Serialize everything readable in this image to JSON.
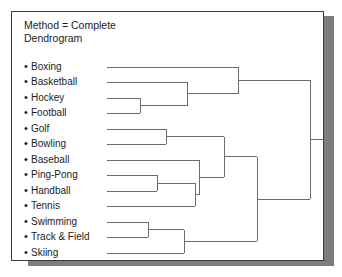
{
  "panel": {
    "header_lines": [
      "Method = Complete",
      "Dendrogram"
    ],
    "bullet_glyph": "•",
    "border_color": "#3a3a3a",
    "shadow_color": "#7d7d7d",
    "background_color": "#ffffff",
    "line_color": "#6b6b6b",
    "text_color": "#1c1c1c"
  },
  "chart_data": {
    "type": "dendrogram",
    "title": "Dendrogram",
    "subtitle": "Method = Complete",
    "method": "Complete",
    "orientation": "horizontal-left-to-right",
    "grid": false,
    "legend": "none",
    "xlabel": "",
    "ylabel": "",
    "leaf_start_x": 95,
    "leaf_first_y": 55,
    "leaf_spacing_y": 15.3,
    "root_x": 298,
    "root_stub_end_x": 322,
    "labels": [
      "Boxing",
      "Basketball",
      "Hockey",
      "Football",
      "Golf",
      "Bowling",
      "Baseball",
      "Ping-Pong",
      "Handball",
      "Tennis",
      "Swimming",
      "Track & Field",
      "Skiing"
    ],
    "leaves": [
      {
        "name": "Boxing",
        "y": 55
      },
      {
        "name": "Basketball",
        "y": 70
      },
      {
        "name": "Hockey",
        "y": 86
      },
      {
        "name": "Football",
        "y": 101
      },
      {
        "name": "Golf",
        "y": 117
      },
      {
        "name": "Bowling",
        "y": 132
      },
      {
        "name": "Baseball",
        "y": 148
      },
      {
        "name": "Ping-Pong",
        "y": 163
      },
      {
        "name": "Handball",
        "y": 179
      },
      {
        "name": "Tennis",
        "y": 194
      },
      {
        "name": "Swimming",
        "y": 210
      },
      {
        "name": "Track & Field",
        "y": 225
      },
      {
        "name": "Skiing",
        "y": 241
      }
    ],
    "merges": [
      {
        "id": "m1",
        "members": [
          "Hockey",
          "Football"
        ],
        "x": 128,
        "y1": 86,
        "y2": 101,
        "y": 93.5
      },
      {
        "id": "m2",
        "members": [
          "Basketball",
          "m1"
        ],
        "x": 175,
        "y1": 70,
        "y2": 93.5,
        "y": 81.8
      },
      {
        "id": "m3",
        "members": [
          "Boxing",
          "m2"
        ],
        "x": 226,
        "y1": 55,
        "y2": 81.8,
        "y": 68.4
      },
      {
        "id": "m4",
        "members": [
          "Golf",
          "Bowling"
        ],
        "x": 154,
        "y1": 117,
        "y2": 132,
        "y": 124.5
      },
      {
        "id": "m5",
        "members": [
          "Ping-Pong",
          "Handball"
        ],
        "x": 145,
        "y1": 163,
        "y2": 179,
        "y": 171.0
      },
      {
        "id": "m6",
        "members": [
          "m5",
          "Tennis"
        ],
        "x": 183,
        "y1": 171,
        "y2": 194,
        "y": 182.5
      },
      {
        "id": "m7",
        "members": [
          "Baseball",
          "m6"
        ],
        "x": 187,
        "y1": 148,
        "y2": 182.5,
        "y": 165.2
      },
      {
        "id": "m8",
        "members": [
          "m4",
          "m7"
        ],
        "x": 212,
        "y1": 124.5,
        "y2": 165.2,
        "y": 144.9
      },
      {
        "id": "m9",
        "members": [
          "Swimming",
          "Track & Field"
        ],
        "x": 136,
        "y1": 210,
        "y2": 225,
        "y": 217.5
      },
      {
        "id": "m10",
        "members": [
          "m9",
          "Skiing"
        ],
        "x": 172,
        "y1": 217.5,
        "y2": 241,
        "y": 229.3
      },
      {
        "id": "m11",
        "members": [
          "m8",
          "m10"
        ],
        "x": 245,
        "y1": 144.9,
        "y2": 229.3,
        "y": 187.1
      },
      {
        "id": "m12",
        "members": [
          "m3",
          "m11"
        ],
        "x": 298,
        "y1": 68.4,
        "y2": 187.1,
        "y": 127.8
      }
    ],
    "clusters": [
      {
        "name": "Team / combat sports",
        "members": [
          "Boxing",
          "Basketball",
          "Hockey",
          "Football"
        ]
      },
      {
        "name": "Ball & racquet sports",
        "members": [
          "Golf",
          "Bowling",
          "Baseball",
          "Ping-Pong",
          "Handball",
          "Tennis"
        ]
      },
      {
        "name": "Individual endurance sports",
        "members": [
          "Swimming",
          "Track & Field",
          "Skiing"
        ]
      }
    ]
  }
}
